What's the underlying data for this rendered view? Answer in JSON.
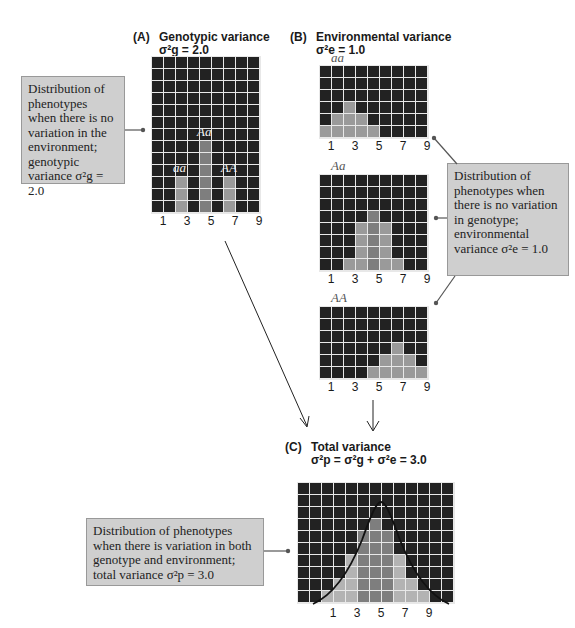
{
  "panel_a": {
    "tag": "(A)",
    "title": "Genotypic variance",
    "formula": "σ²g = 2.0",
    "grid": {
      "cols": 9,
      "rows": 13,
      "heights": [
        0,
        0,
        3,
        0,
        6,
        0,
        3,
        0,
        0
      ],
      "shade": [
        0,
        0,
        1,
        0,
        2,
        0,
        1,
        0,
        0
      ]
    },
    "axis_labels": [
      "1",
      "3",
      "5",
      "7",
      "9"
    ],
    "genotype_labels": {
      "aa": "aa",
      "Aa": "Aa",
      "AA": "AA"
    },
    "callout": "Distribution of phenotypes when there is no variation in the environment; genotypic variance σ²g = 2.0"
  },
  "panel_b": {
    "tag": "(B)",
    "title": "Environmental variance",
    "formula": "σ²e = 1.0",
    "grids": [
      {
        "label": "aa",
        "cols": 9,
        "rows": 6,
        "heights": [
          1,
          2,
          3,
          2,
          1,
          0,
          0,
          0,
          0
        ]
      },
      {
        "label": "Aa",
        "cols": 9,
        "rows": 8,
        "heights": [
          0,
          0,
          1,
          4,
          5,
          4,
          1,
          0,
          0
        ]
      },
      {
        "label": "AA",
        "cols": 9,
        "rows": 6,
        "heights": [
          0,
          0,
          0,
          0,
          1,
          2,
          3,
          2,
          1
        ]
      }
    ],
    "axis_labels": [
      "1",
      "3",
      "5",
      "7",
      "9"
    ],
    "callout": "Distribution of phenotypes when there is no variation in genotype; environmental variance σ²e = 1.0"
  },
  "panel_c": {
    "tag": "(C)",
    "title": "Total variance",
    "formula": "σ²p = σ²g + σ²e = 3.0",
    "grid": {
      "cols": 13,
      "rows": 10,
      "heights": [
        0,
        0,
        1,
        2,
        4,
        6,
        7,
        6,
        4,
        2,
        1,
        0,
        0
      ]
    },
    "axis_labels": [
      "1",
      "3",
      "5",
      "7",
      "9"
    ],
    "callout": "Distribution of phenotypes when there is variation in both genotype and environment; total variance σ²p = 3.0"
  },
  "colors": {
    "cell_empty": "#222222",
    "cell_filled": "#9a9a9a",
    "cell_center": "#7e7e7e",
    "grid_line": "#e8e8e8",
    "callout_bg": "#cfcfcf"
  }
}
